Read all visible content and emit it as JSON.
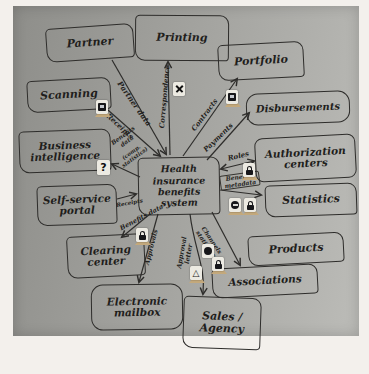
{
  "colors": {
    "paper": "#a2a29e",
    "ink": "#2e2d2b",
    "sticker_base": "#c4a97c",
    "sticker_card": "#eceae2"
  },
  "nodes": {
    "partner": {
      "label": "Partner"
    },
    "printing": {
      "label": "Printing"
    },
    "portfolio": {
      "label": "Portfolio"
    },
    "scanning": {
      "label": "Scanning"
    },
    "disbursements": {
      "label": "Disbursements"
    },
    "business_intelligence": {
      "label": "Business intelligence"
    },
    "authorization_centers": {
      "label": "Authorization centers"
    },
    "self_service_portal": {
      "label": "Self-service portal"
    },
    "statistics": {
      "label": "Statistics"
    },
    "center": {
      "label": "Health insurance benefits system"
    },
    "clearing_center": {
      "label": "Clearing center"
    },
    "products": {
      "label": "Products"
    },
    "electronic_mailbox": {
      "label": "Electronic mailbox"
    },
    "associations": {
      "label": "Associations"
    },
    "sales_agency": {
      "label": "Sales / Agency"
    }
  },
  "edges": {
    "partner": {
      "label": "Partner data"
    },
    "scanning": {
      "label": "Receipts"
    },
    "printing": {
      "label": "Correspondence"
    },
    "portfolio": {
      "label": "Contracts"
    },
    "disbursements": {
      "label": "Payments"
    },
    "authorization": {
      "label": "Roles"
    },
    "statistics": {
      "label": "Benefits metadata"
    },
    "business_intelligence": {
      "label": "Benefits data",
      "label2": "(comp. statistics)"
    },
    "self_service": {
      "label": "Receipts"
    },
    "clearing": {
      "label": "Benefits data"
    },
    "mailbox": {
      "label": "Approvals"
    },
    "sales": {
      "label": "Approval letter"
    },
    "associations": {
      "label": "Channels statistics"
    }
  },
  "icons": {
    "question": "?",
    "warning": "△"
  }
}
